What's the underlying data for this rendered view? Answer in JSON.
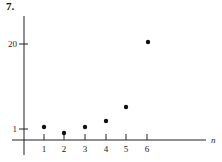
{
  "figure": {
    "label": "7."
  },
  "chart_data": {
    "type": "scatter",
    "title": "7.",
    "xlabel": "n",
    "ylabel": "",
    "x": [
      1,
      2,
      3,
      4,
      5,
      6
    ],
    "values": [
      1.1,
      0.8,
      1.1,
      2.5,
      5,
      20
    ],
    "x_ticks": [
      "1",
      "2",
      "3",
      "4",
      "5",
      "6"
    ],
    "y_ticks": [
      "1",
      "20"
    ],
    "grid": false,
    "legend": null,
    "note": "schematic y-axis: tick 1 and tick 20 marked; values estimated"
  },
  "axis": {
    "x_label": "n",
    "x_ticks": [
      {
        "label": "1",
        "px": 44
      },
      {
        "label": "2",
        "px": 64
      },
      {
        "label": "3",
        "px": 85
      },
      {
        "label": "4",
        "px": 106
      },
      {
        "label": "5",
        "px": 126
      },
      {
        "label": "6",
        "px": 147
      }
    ],
    "y_ticks": [
      {
        "label": "20",
        "py": 44
      },
      {
        "label": "1",
        "py": 129
      }
    ]
  },
  "points": [
    {
      "n": 1,
      "px": 44,
      "py": 127
    },
    {
      "n": 2,
      "px": 64,
      "py": 133
    },
    {
      "n": 3,
      "px": 85,
      "py": 127
    },
    {
      "n": 4,
      "px": 106,
      "py": 121
    },
    {
      "n": 5,
      "px": 126,
      "py": 107
    },
    {
      "n": 6,
      "px": 148,
      "py": 42
    }
  ]
}
